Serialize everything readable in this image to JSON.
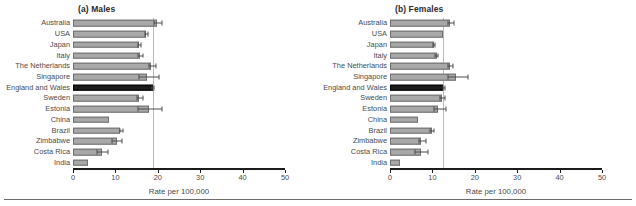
{
  "figure": {
    "footer_rule": true,
    "colors": {
      "bar_fill": "#a8a8a8",
      "bar_stroke": "#6f6f6f",
      "highlight_fill": "#1b1b1b",
      "reference_line": "#b9b9b9",
      "axis": "#1b1b1b",
      "text": "#4a4a4a"
    }
  },
  "chart_data": [
    {
      "type": "bar",
      "orientation": "horizontal",
      "title": "(a) Males",
      "xlabel": "Rate per 100,000",
      "ylabel": "",
      "xlim": [
        0,
        50
      ],
      "xticks": [
        0,
        10,
        20,
        30,
        40,
        50
      ],
      "xtick_labels": [
        "0",
        "10",
        "20",
        "30",
        "40",
        "50"
      ],
      "grid": false,
      "legend": "none",
      "reference_line": 18.8,
      "highlight_category": "England and Wales",
      "categories": [
        "Australia",
        "USA",
        "Japan",
        "Italy",
        "The Netherlands",
        "Singapore",
        "England and Wales",
        "Sweden",
        "Estonia",
        "China",
        "Brazil",
        "Zimbabwe",
        "Costa Rica",
        "India"
      ],
      "values": [
        19.9,
        17.3,
        15.6,
        15.8,
        18.5,
        17.4,
        18.8,
        15.6,
        17.9,
        8.6,
        11.2,
        10.3,
        6.8,
        3.6
      ],
      "errors_low": [
        19.2,
        17.0,
        15.3,
        15.4,
        17.9,
        15.6,
        18.6,
        15.0,
        15.4,
        8.6,
        11.2,
        9.3,
        5.6,
        3.6
      ],
      "errors_high": [
        21.0,
        17.8,
        16.0,
        16.4,
        19.5,
        20.4,
        19.2,
        16.6,
        20.9,
        8.6,
        11.8,
        11.5,
        8.3,
        3.6
      ]
    },
    {
      "type": "bar",
      "orientation": "horizontal",
      "title": "(b) Females",
      "xlabel": "Rate per 100,000",
      "ylabel": "",
      "xlim": [
        0,
        50
      ],
      "xticks": [
        0,
        10,
        20,
        30,
        40,
        50
      ],
      "xtick_labels": [
        "0",
        "10",
        "20",
        "30",
        "40",
        "50"
      ],
      "grid": false,
      "legend": "none",
      "reference_line": 12.6,
      "highlight_category": "England and Wales",
      "categories": [
        "Australia",
        "USA",
        "Japan",
        "Italy",
        "The Netherlands",
        "Singapore",
        "England and Wales",
        "Sweden",
        "Estonia",
        "China",
        "Brazil",
        "Zimbabwe",
        "Costa Rica",
        "India"
      ],
      "values": [
        14.1,
        12.6,
        10.4,
        11.0,
        14.2,
        15.6,
        12.6,
        12.2,
        11.4,
        6.6,
        10.0,
        7.4,
        7.2,
        2.3
      ],
      "errors_low": [
        13.6,
        12.6,
        10.2,
        10.7,
        13.7,
        13.6,
        12.4,
        11.8,
        10.4,
        6.6,
        9.5,
        6.8,
        6.0,
        2.3
      ],
      "errors_high": [
        15.1,
        12.6,
        10.7,
        11.4,
        14.9,
        18.3,
        12.9,
        13.0,
        13.3,
        6.6,
        10.4,
        8.4,
        8.9,
        2.3
      ]
    }
  ]
}
